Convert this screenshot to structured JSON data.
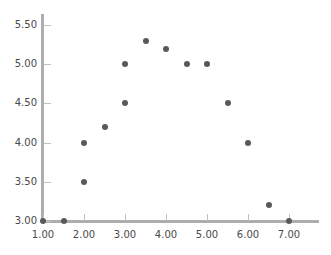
{
  "chart_data": {
    "type": "scatter",
    "title": "",
    "subtitle": "",
    "xlabel": "",
    "ylabel": "",
    "xlim": [
      1.0,
      7.2
    ],
    "ylim": [
      3.0,
      5.6
    ],
    "grid": false,
    "legend": null,
    "marker": {
      "shape": "circle",
      "color": "#595959",
      "size_px": 6
    },
    "axis_color": "#adadad",
    "tick_color": "#c2c2c2",
    "label_color": "#4a4a4a",
    "xticks": [
      1.0,
      2.0,
      3.0,
      4.0,
      5.0,
      6.0,
      7.0
    ],
    "xtick_labels": [
      "1.00",
      "2.00",
      "3.00",
      "4.00",
      "5.00",
      "6.00",
      "7.00"
    ],
    "yticks": [
      3.0,
      3.5,
      4.0,
      4.5,
      5.0,
      5.5
    ],
    "ytick_labels": [
      "3.00",
      "3.50",
      "4.00",
      "4.50",
      "5.00",
      "5.50"
    ],
    "points": [
      {
        "x": 1.0,
        "y": 3.0
      },
      {
        "x": 1.5,
        "y": 3.0
      },
      {
        "x": 2.0,
        "y": 3.5
      },
      {
        "x": 2.0,
        "y": 4.0
      },
      {
        "x": 2.5,
        "y": 4.2
      },
      {
        "x": 3.0,
        "y": 4.5
      },
      {
        "x": 3.0,
        "y": 5.0
      },
      {
        "x": 3.5,
        "y": 5.3
      },
      {
        "x": 4.0,
        "y": 5.19
      },
      {
        "x": 4.5,
        "y": 5.0
      },
      {
        "x": 5.0,
        "y": 5.0
      },
      {
        "x": 5.5,
        "y": 4.51
      },
      {
        "x": 6.0,
        "y": 4.0
      },
      {
        "x": 6.5,
        "y": 3.2
      },
      {
        "x": 7.0,
        "y": 3.0
      }
    ]
  }
}
